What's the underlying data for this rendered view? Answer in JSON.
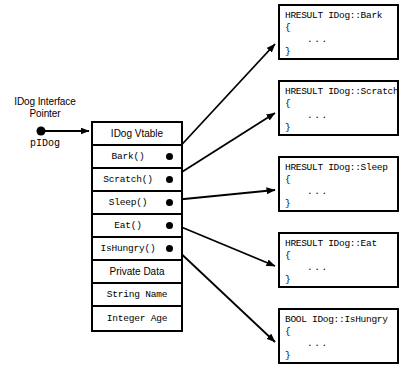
{
  "diagram": {
    "pointer": {
      "label_line1": "IDog Interface",
      "label_line2": "Pointer",
      "variable": "pIDog"
    },
    "vtable": {
      "header": "IDog Vtable",
      "rows": [
        {
          "label": "IDog Vtable",
          "kind": "header",
          "has_pointer_dot": false
        },
        {
          "label": "Bark()",
          "kind": "method",
          "has_pointer_dot": true
        },
        {
          "label": "Scratch()",
          "kind": "method",
          "has_pointer_dot": true
        },
        {
          "label": "Sleep()",
          "kind": "method",
          "has_pointer_dot": true
        },
        {
          "label": "Eat()",
          "kind": "method",
          "has_pointer_dot": true
        },
        {
          "label": "IsHungry()",
          "kind": "method",
          "has_pointer_dot": true
        },
        {
          "label": "Private Data",
          "kind": "section",
          "has_pointer_dot": false
        },
        {
          "label": "String Name",
          "kind": "field",
          "has_pointer_dot": false
        },
        {
          "label": "Integer Age",
          "kind": "field",
          "has_pointer_dot": false
        }
      ]
    },
    "implementations": [
      {
        "signature": "HRESULT IDog::Bark",
        "open_brace": "{",
        "body": "...",
        "close_brace": "}"
      },
      {
        "signature": "HRESULT IDog::Scratch",
        "open_brace": "{",
        "body": "...",
        "close_brace": "}"
      },
      {
        "signature": "HRESULT IDog::Sleep",
        "open_brace": "{",
        "body": "...",
        "close_brace": "}"
      },
      {
        "signature": "HRESULT IDog::Eat",
        "open_brace": "{",
        "body": "...",
        "close_brace": "}"
      },
      {
        "signature": "BOOL IDog::IsHungry",
        "open_brace": "{",
        "body": "...",
        "close_brace": "}"
      }
    ],
    "colors": {
      "background": "#ffffff",
      "stroke": "#000000",
      "text": "#000000"
    }
  }
}
